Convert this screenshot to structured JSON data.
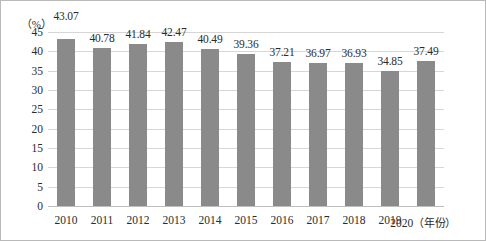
{
  "chart_data": {
    "type": "bar",
    "title": "",
    "xlabel": "年份",
    "ylabel": "",
    "unit_label": "（%）",
    "xaxis_suffix": "（年份）",
    "categories": [
      "2010",
      "2011",
      "2012",
      "2013",
      "2014",
      "2015",
      "2016",
      "2017",
      "2018",
      "2019",
      "2020"
    ],
    "values": [
      43.07,
      40.78,
      41.84,
      42.47,
      40.49,
      39.36,
      37.21,
      36.97,
      36.93,
      34.85,
      37.49
    ],
    "value_labels": [
      "43.07",
      "40.78",
      "41.84",
      "42.47",
      "40.49",
      "39.36",
      "37.21",
      "36.97",
      "36.93",
      "34.85",
      "37.49"
    ],
    "ylim": [
      0,
      45
    ],
    "ytick_values": [
      0,
      5,
      10,
      15,
      20,
      25,
      30,
      35,
      40,
      45
    ],
    "ytick_labels": [
      "0",
      "5",
      "10",
      "15",
      "20",
      "25",
      "30",
      "35",
      "40",
      "45"
    ],
    "grid": true,
    "grid_axis": "y",
    "legend": false,
    "bar_color": "#8a8a8a",
    "gridline_color": "#d6d6d6",
    "text_color": "#2b2b2b",
    "border_color": "#b9b9b9"
  }
}
